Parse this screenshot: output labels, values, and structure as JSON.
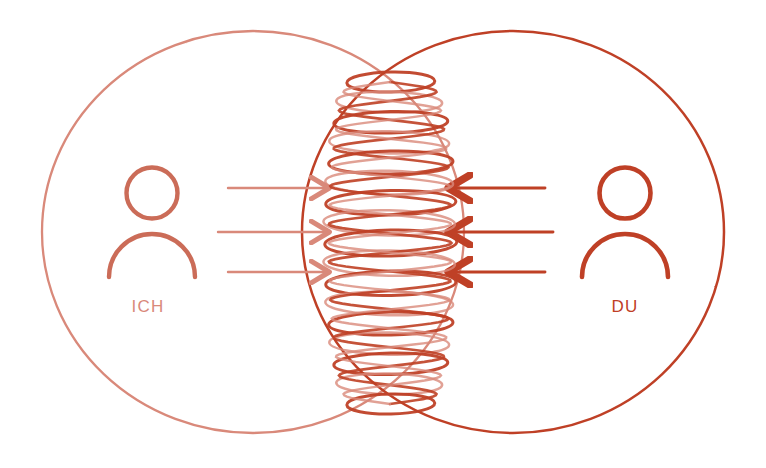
{
  "diagram": {
    "background_color": "#ffffff",
    "style": "hand-drawn line illustration"
  },
  "colors": {
    "left_light_red": "#d9897a",
    "left_light_red_soft": "#e0a095",
    "right_strong_red": "#bf4026",
    "right_strong_red_soft": "#c8563c",
    "coil_light": "#d9897a",
    "coil_strong": "#bf4026",
    "background": "#ffffff"
  },
  "left_side": {
    "label": "ICH",
    "label_color": "#d9897a",
    "circle": {
      "cx": 253,
      "cy": 232,
      "rx": 211,
      "ry": 201,
      "stroke": "#d9897a"
    },
    "person_icon": {
      "name": "person-icon",
      "cx": 152,
      "cy": 225
    },
    "arrows": [
      {
        "y": 188,
        "x1": 228,
        "x2": 327,
        "direction": "right"
      },
      {
        "y": 232,
        "x1": 218,
        "x2": 327,
        "direction": "right"
      },
      {
        "y": 272,
        "x1": 228,
        "x2": 327,
        "direction": "right"
      }
    ]
  },
  "right_side": {
    "label": "DU",
    "label_color": "#bf4026",
    "circle": {
      "cx": 513,
      "cy": 232,
      "rx": 211,
      "ry": 201,
      "stroke": "#bf4026"
    },
    "person_icon": {
      "name": "person-icon",
      "cx": 625,
      "cy": 225
    },
    "arrows": [
      {
        "y": 188,
        "x1": 545,
        "x2": 451,
        "direction": "left"
      },
      {
        "y": 232,
        "x1": 553,
        "x2": 451,
        "direction": "left"
      },
      {
        "y": 272,
        "x1": 545,
        "x2": 451,
        "direction": "left"
      }
    ]
  },
  "center_coil": {
    "name": "resonance-coil",
    "description": "stacked ellipse coil / spring in the overlap region",
    "x_center": 390,
    "y_top": 82,
    "y_bottom": 404,
    "loop_count": 17,
    "max_half_width": 66,
    "min_half_width": 44
  }
}
